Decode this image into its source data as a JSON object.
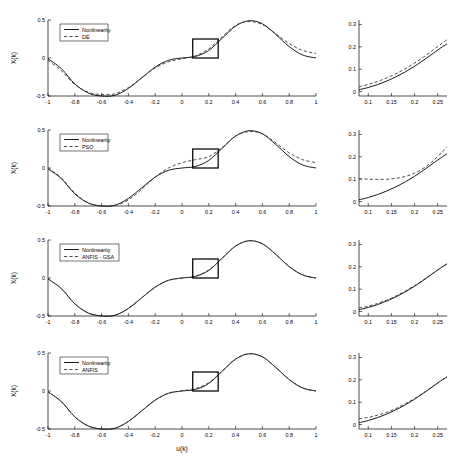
{
  "figure": {
    "background": "#ffffff",
    "solid_color": "#000000",
    "dashed_color": "#3a3a3a",
    "xlabel": "u(k)",
    "ylabel": "X(k)",
    "rows": 4
  },
  "chart_data": [
    {
      "type": "line",
      "panel": "main",
      "row": 1,
      "title": "",
      "xlabel": "",
      "ylabel": "X(k)",
      "xlim": [
        -1,
        1
      ],
      "ylim": [
        -0.5,
        0.5
      ],
      "xticks": [
        -1,
        -0.8,
        -0.6,
        -0.4,
        -0.2,
        0,
        0.2,
        0.4,
        0.6,
        0.8,
        1
      ],
      "xticklabels": [
        "-1",
        "-0.8",
        "-0.6",
        "-0.4",
        "-0.2",
        "0",
        "0.2",
        "0.4",
        "0.6",
        "0.8",
        "1"
      ],
      "yticks": [
        -0.5,
        0,
        0.5
      ],
      "yticklabels": [
        "-0.5",
        "0",
        "0.5"
      ],
      "grid": false,
      "legend": [
        "Nonlinearity",
        "DE"
      ],
      "legend_position": "upper left",
      "highlight_box": {
        "x0": 0.08,
        "x1": 0.27,
        "y0": 0.0,
        "y1": 0.25
      },
      "x": [
        -1,
        -0.9,
        -0.8,
        -0.7,
        -0.6,
        -0.5,
        -0.4,
        -0.3,
        -0.2,
        -0.1,
        0,
        0.1,
        0.2,
        0.3,
        0.4,
        0.5,
        0.6,
        0.7,
        0.8,
        0.9,
        1
      ],
      "series": [
        {
          "name": "Nonlinearity",
          "style": "solid",
          "values": [
            -0.01,
            -0.14,
            -0.34,
            -0.46,
            -0.5,
            -0.49,
            -0.4,
            -0.26,
            -0.12,
            -0.03,
            0.0,
            0.02,
            0.1,
            0.26,
            0.42,
            0.49,
            0.45,
            0.31,
            0.15,
            0.04,
            0.0
          ]
        },
        {
          "name": "DE",
          "style": "dashed",
          "values": [
            -0.03,
            -0.17,
            -0.35,
            -0.45,
            -0.48,
            -0.47,
            -0.39,
            -0.26,
            -0.13,
            -0.05,
            -0.01,
            0.03,
            0.12,
            0.28,
            0.43,
            0.48,
            0.44,
            0.32,
            0.19,
            0.1,
            0.06
          ]
        }
      ]
    },
    {
      "type": "line",
      "panel": "inset",
      "row": 1,
      "title": "",
      "xlabel": "",
      "ylabel": "",
      "xlim": [
        0.08,
        0.27
      ],
      "ylim": [
        -0.02,
        0.32
      ],
      "xticks": [
        0.1,
        0.15,
        0.2,
        0.25
      ],
      "xticklabels": [
        "0.1",
        "0.15",
        "0.2",
        "0.25"
      ],
      "yticks": [
        0,
        0.1,
        0.2,
        0.3
      ],
      "yticklabels": [
        "0",
        "0.1",
        "0.2",
        "0.3"
      ],
      "grid": false,
      "x": [
        0.08,
        0.1,
        0.12,
        0.14,
        0.16,
        0.18,
        0.2,
        0.22,
        0.24,
        0.26,
        0.27
      ],
      "series": [
        {
          "name": "Nonlinearity",
          "style": "solid",
          "values": [
            0.008,
            0.018,
            0.031,
            0.047,
            0.066,
            0.088,
            0.113,
            0.141,
            0.171,
            0.2,
            0.213
          ]
        },
        {
          "name": "DE",
          "style": "dashed",
          "values": [
            0.021,
            0.032,
            0.045,
            0.061,
            0.08,
            0.102,
            0.127,
            0.155,
            0.186,
            0.217,
            0.232
          ]
        }
      ]
    },
    {
      "type": "line",
      "panel": "main",
      "row": 2,
      "title": "",
      "xlabel": "",
      "ylabel": "X(k)",
      "xlim": [
        -1,
        1
      ],
      "ylim": [
        -0.5,
        0.5
      ],
      "xticks": [
        -1,
        -0.8,
        -0.6,
        -0.4,
        -0.2,
        0,
        0.2,
        0.4,
        0.6,
        0.8,
        1
      ],
      "xticklabels": [
        "-1",
        "-0.8",
        "-0.6",
        "-0.4",
        "-0.2",
        "0",
        "0.2",
        "0.4",
        "0.6",
        "0.8",
        "1"
      ],
      "yticks": [
        -0.5,
        0,
        0.5
      ],
      "yticklabels": [
        "-0.5",
        "0",
        "0.5"
      ],
      "grid": false,
      "legend": [
        "Nonlinearity",
        "PSO"
      ],
      "legend_position": "upper left",
      "highlight_box": {
        "x0": 0.08,
        "x1": 0.27,
        "y0": 0.0,
        "y1": 0.25
      },
      "x": [
        -1,
        -0.9,
        -0.8,
        -0.7,
        -0.6,
        -0.5,
        -0.4,
        -0.3,
        -0.2,
        -0.1,
        0,
        0.1,
        0.2,
        0.3,
        0.4,
        0.5,
        0.6,
        0.7,
        0.8,
        0.9,
        1
      ],
      "series": [
        {
          "name": "Nonlinearity",
          "style": "solid",
          "values": [
            -0.01,
            -0.14,
            -0.34,
            -0.46,
            -0.5,
            -0.49,
            -0.4,
            -0.26,
            -0.12,
            -0.03,
            0.0,
            0.02,
            0.1,
            0.26,
            0.42,
            0.49,
            0.45,
            0.31,
            0.15,
            0.04,
            0.0
          ]
        },
        {
          "name": "PSO",
          "style": "dashed",
          "values": [
            -0.0,
            -0.13,
            -0.33,
            -0.46,
            -0.5,
            -0.49,
            -0.42,
            -0.28,
            -0.12,
            0.0,
            0.07,
            0.11,
            0.15,
            0.27,
            0.42,
            0.48,
            0.45,
            0.33,
            0.2,
            0.11,
            0.07
          ]
        }
      ]
    },
    {
      "type": "line",
      "panel": "inset",
      "row": 2,
      "title": "",
      "xlabel": "",
      "ylabel": "",
      "xlim": [
        0.08,
        0.27
      ],
      "ylim": [
        -0.02,
        0.32
      ],
      "xticks": [
        0.1,
        0.15,
        0.2,
        0.25
      ],
      "xticklabels": [
        "0.1",
        "0.15",
        "0.2",
        "0.25"
      ],
      "yticks": [
        0,
        0.1,
        0.2,
        0.3
      ],
      "yticklabels": [
        "0",
        "0.1",
        "0.2",
        "0.3"
      ],
      "grid": false,
      "x": [
        0.08,
        0.1,
        0.12,
        0.14,
        0.16,
        0.18,
        0.2,
        0.22,
        0.24,
        0.26,
        0.27
      ],
      "series": [
        {
          "name": "Nonlinearity",
          "style": "solid",
          "values": [
            0.008,
            0.018,
            0.031,
            0.047,
            0.066,
            0.088,
            0.113,
            0.141,
            0.171,
            0.2,
            0.213
          ]
        },
        {
          "name": "PSO",
          "style": "dashed",
          "values": [
            0.102,
            0.1,
            0.099,
            0.1,
            0.104,
            0.112,
            0.127,
            0.15,
            0.182,
            0.222,
            0.245
          ]
        }
      ]
    },
    {
      "type": "line",
      "panel": "main",
      "row": 3,
      "title": "",
      "xlabel": "",
      "ylabel": "X(k)",
      "xlim": [
        -1,
        1
      ],
      "ylim": [
        -0.5,
        0.5
      ],
      "xticks": [
        -1,
        -0.8,
        -0.6,
        -0.4,
        -0.2,
        0,
        0.2,
        0.4,
        0.6,
        0.8,
        1
      ],
      "xticklabels": [
        "-1",
        "-0.8",
        "-0.6",
        "-0.4",
        "-0.2",
        "0",
        "0.2",
        "0.4",
        "0.6",
        "0.8",
        "1"
      ],
      "yticks": [
        -0.5,
        0,
        0.5
      ],
      "yticklabels": [
        "-0.5",
        "0",
        "0.5"
      ],
      "grid": false,
      "legend": [
        "Nonlinearity",
        "ANFIS - GSA"
      ],
      "legend_position": "upper left",
      "highlight_box": {
        "x0": 0.08,
        "x1": 0.27,
        "y0": 0.0,
        "y1": 0.25
      },
      "x": [
        -1,
        -0.9,
        -0.8,
        -0.7,
        -0.6,
        -0.5,
        -0.4,
        -0.3,
        -0.2,
        -0.1,
        0,
        0.1,
        0.2,
        0.3,
        0.4,
        0.5,
        0.6,
        0.7,
        0.8,
        0.9,
        1
      ],
      "series": [
        {
          "name": "Nonlinearity",
          "style": "solid",
          "values": [
            -0.01,
            -0.14,
            -0.34,
            -0.46,
            -0.5,
            -0.49,
            -0.4,
            -0.26,
            -0.12,
            -0.03,
            0.0,
            0.02,
            0.1,
            0.26,
            0.42,
            0.49,
            0.45,
            0.31,
            0.15,
            0.04,
            0.0
          ]
        },
        {
          "name": "ANFIS - GSA",
          "style": "dashed",
          "values": [
            -0.01,
            -0.14,
            -0.34,
            -0.46,
            -0.5,
            -0.49,
            -0.4,
            -0.26,
            -0.12,
            -0.03,
            0.0,
            0.025,
            0.105,
            0.263,
            0.421,
            0.49,
            0.451,
            0.311,
            0.151,
            0.042,
            0.0
          ]
        }
      ]
    },
    {
      "type": "line",
      "panel": "inset",
      "row": 3,
      "title": "",
      "xlabel": "",
      "ylabel": "",
      "xlim": [
        0.08,
        0.27
      ],
      "ylim": [
        -0.02,
        0.32
      ],
      "xticks": [
        0.1,
        0.15,
        0.2,
        0.25
      ],
      "xticklabels": [
        "0.1",
        "0.15",
        "0.2",
        "0.25"
      ],
      "yticks": [
        0,
        0.1,
        0.2,
        0.3
      ],
      "yticklabels": [
        "0",
        "0.1",
        "0.2",
        "0.3"
      ],
      "grid": false,
      "x": [
        0.08,
        0.1,
        0.12,
        0.14,
        0.16,
        0.18,
        0.2,
        0.22,
        0.24,
        0.26,
        0.27
      ],
      "series": [
        {
          "name": "Nonlinearity",
          "style": "solid",
          "values": [
            0.008,
            0.018,
            0.031,
            0.047,
            0.066,
            0.088,
            0.113,
            0.141,
            0.171,
            0.2,
            0.213
          ]
        },
        {
          "name": "ANFIS - GSA",
          "style": "dashed",
          "values": [
            0.016,
            0.024,
            0.036,
            0.051,
            0.07,
            0.092,
            0.116,
            0.143,
            0.172,
            0.201,
            0.213
          ]
        }
      ]
    },
    {
      "type": "line",
      "panel": "main",
      "row": 4,
      "title": "",
      "xlabel": "u(k)",
      "ylabel": "X(k)",
      "xlim": [
        -1,
        1
      ],
      "ylim": [
        -0.5,
        0.5
      ],
      "xticks": [
        -1,
        -0.8,
        -0.6,
        -0.4,
        -0.2,
        0,
        0.2,
        0.4,
        0.6,
        0.8,
        1
      ],
      "xticklabels": [
        "-1",
        "-0.8",
        "-0.6",
        "-0.4",
        "-0.2",
        "0",
        "0.2",
        "0.4",
        "0.6",
        "0.8",
        "1"
      ],
      "yticks": [
        -0.5,
        0,
        0.5
      ],
      "yticklabels": [
        "-0.5",
        "0",
        "0.5"
      ],
      "grid": false,
      "legend": [
        "Nonlinearity",
        "ANFIS"
      ],
      "legend_position": "upper left",
      "highlight_box": {
        "x0": 0.08,
        "x1": 0.27,
        "y0": 0.0,
        "y1": 0.25
      },
      "x": [
        -1,
        -0.9,
        -0.8,
        -0.7,
        -0.6,
        -0.5,
        -0.4,
        -0.3,
        -0.2,
        -0.1,
        0,
        0.1,
        0.2,
        0.3,
        0.4,
        0.5,
        0.6,
        0.7,
        0.8,
        0.9,
        1
      ],
      "series": [
        {
          "name": "Nonlinearity",
          "style": "solid",
          "values": [
            -0.01,
            -0.14,
            -0.34,
            -0.46,
            -0.5,
            -0.49,
            -0.4,
            -0.26,
            -0.12,
            -0.03,
            0.0,
            0.02,
            0.1,
            0.26,
            0.42,
            0.49,
            0.45,
            0.31,
            0.15,
            0.04,
            0.0
          ]
        },
        {
          "name": "ANFIS",
          "style": "dashed",
          "values": [
            -0.01,
            -0.14,
            -0.34,
            -0.46,
            -0.5,
            -0.49,
            -0.4,
            -0.26,
            -0.12,
            -0.028,
            0.004,
            0.032,
            0.108,
            0.263,
            0.42,
            0.489,
            0.45,
            0.311,
            0.151,
            0.042,
            0.0
          ]
        }
      ]
    },
    {
      "type": "line",
      "panel": "inset",
      "row": 4,
      "title": "",
      "xlabel": "",
      "ylabel": "",
      "xlim": [
        0.08,
        0.27
      ],
      "ylim": [
        -0.02,
        0.32
      ],
      "xticks": [
        0.1,
        0.15,
        0.2,
        0.25
      ],
      "xticklabels": [
        "0.1",
        "0.15",
        "0.2",
        "0.25"
      ],
      "yticks": [
        0,
        0.1,
        0.2,
        0.3
      ],
      "yticklabels": [
        "0",
        "0.1",
        "0.2",
        "0.3"
      ],
      "grid": false,
      "x": [
        0.08,
        0.1,
        0.12,
        0.14,
        0.16,
        0.18,
        0.2,
        0.22,
        0.24,
        0.26,
        0.27
      ],
      "series": [
        {
          "name": "Nonlinearity",
          "style": "solid",
          "values": [
            0.008,
            0.018,
            0.031,
            0.047,
            0.066,
            0.088,
            0.113,
            0.141,
            0.171,
            0.2,
            0.213
          ]
        },
        {
          "name": "ANFIS",
          "style": "dashed",
          "values": [
            0.026,
            0.032,
            0.042,
            0.055,
            0.072,
            0.093,
            0.117,
            0.143,
            0.172,
            0.201,
            0.213
          ]
        }
      ]
    }
  ]
}
